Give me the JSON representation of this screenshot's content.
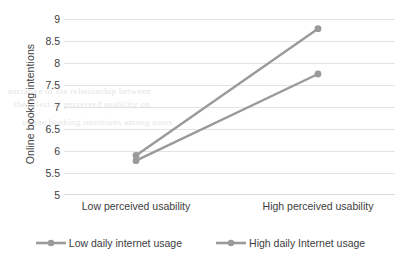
{
  "chart_data": {
    "type": "line",
    "title": "",
    "xlabel": "",
    "ylabel": "Online booking intentions",
    "categories": [
      "Low perceived usability",
      "High perceived usability"
    ],
    "ylim": [
      5,
      9
    ],
    "ytick_labels": [
      "5",
      "5.5",
      "6",
      "6.5",
      "7",
      "7.5",
      "8",
      "8.5",
      "9"
    ],
    "ytick_values": [
      5,
      5.5,
      6,
      6.5,
      7,
      7.5,
      8,
      8.5,
      9
    ],
    "grid": true,
    "legend_position": "bottom",
    "series": [
      {
        "name": "Low daily internet usage",
        "values": [
          5.78,
          7.75
        ],
        "color": "#9a9a9a",
        "marker": "circle"
      },
      {
        "name": "High daily Internet usage",
        "values": [
          5.9,
          8.78
        ],
        "color": "#9a9a9a",
        "marker": "circle"
      }
    ]
  },
  "legend": {
    "items": [
      {
        "label": "Low daily internet usage"
      },
      {
        "label": "High daily Internet usage"
      }
    ]
  },
  "background_text": {
    "line1": "narrative of the relationship between",
    "line2": "the effect of perceived usability on",
    "line3": "online booking intentions among users"
  }
}
